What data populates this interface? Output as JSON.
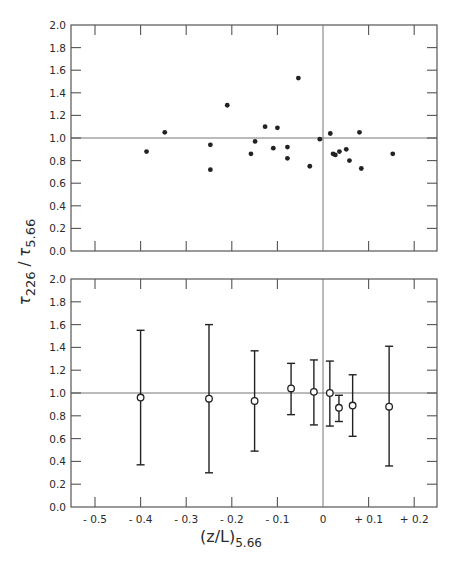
{
  "chart_data": [
    {
      "type": "scatter",
      "title": "",
      "panel": "top",
      "xlabel": "(z/L)5.66",
      "ylabel": "τ226 / τ5.66",
      "xlim": [
        -0.56,
        0.25
      ],
      "ylim": [
        0.0,
        2.0
      ],
      "xticks": [
        -0.5,
        -0.4,
        -0.3,
        -0.2,
        -0.1,
        0.0,
        0.1,
        0.2
      ],
      "yticks": [
        0.0,
        0.2,
        0.4,
        0.6,
        0.8,
        1.0,
        1.2,
        1.4,
        1.6,
        1.8,
        2.0
      ],
      "ytick_labels": [
        "0.0",
        "0.2",
        "0.4",
        "0.6",
        "0.8",
        "1.0",
        "1.2",
        "1.4",
        "1.6",
        "1.8",
        "2.0"
      ],
      "reference_lines": {
        "horizontal_y": 1.0,
        "vertical_x": 0.0
      },
      "grid": false,
      "marker": "filled-circle",
      "points": [
        {
          "x": -0.387,
          "y": 0.88
        },
        {
          "x": -0.347,
          "y": 1.05
        },
        {
          "x": -0.247,
          "y": 0.94
        },
        {
          "x": -0.247,
          "y": 0.72
        },
        {
          "x": -0.21,
          "y": 1.29
        },
        {
          "x": -0.158,
          "y": 0.86
        },
        {
          "x": -0.149,
          "y": 0.97
        },
        {
          "x": -0.127,
          "y": 1.1
        },
        {
          "x": -0.109,
          "y": 0.91
        },
        {
          "x": -0.1,
          "y": 1.09
        },
        {
          "x": -0.078,
          "y": 0.92
        },
        {
          "x": -0.078,
          "y": 0.82
        },
        {
          "x": -0.054,
          "y": 1.53
        },
        {
          "x": -0.029,
          "y": 0.75
        },
        {
          "x": -0.007,
          "y": 0.99
        },
        {
          "x": 0.016,
          "y": 1.04
        },
        {
          "x": 0.022,
          "y": 0.86
        },
        {
          "x": 0.027,
          "y": 0.85
        },
        {
          "x": 0.036,
          "y": 0.88
        },
        {
          "x": 0.051,
          "y": 0.9
        },
        {
          "x": 0.058,
          "y": 0.8
        },
        {
          "x": 0.08,
          "y": 1.05
        },
        {
          "x": 0.084,
          "y": 0.73
        },
        {
          "x": 0.153,
          "y": 0.86
        }
      ]
    },
    {
      "type": "scatter",
      "title": "",
      "panel": "bottom",
      "subtype": "errorbar",
      "xlabel": "(z/L)5.66",
      "ylabel": "τ226 / τ5.66",
      "xlim": [
        -0.56,
        0.25
      ],
      "ylim": [
        0.0,
        2.0
      ],
      "xticks": [
        -0.5,
        -0.4,
        -0.3,
        -0.2,
        -0.1,
        0.0,
        0.1,
        0.2
      ],
      "xtick_labels": [
        "- 0.5",
        "- 0.4",
        "- 0.3",
        "- 0.2",
        "- 0.1",
        "0",
        "+ 0.1",
        "+ 0.2"
      ],
      "yticks": [
        0.0,
        0.2,
        0.4,
        0.6,
        0.8,
        1.0,
        1.2,
        1.4,
        1.6,
        1.8,
        2.0
      ],
      "ytick_labels": [
        "0.0",
        "0.2",
        "0.4",
        "0.6",
        "0.8",
        "1.0",
        "1.2",
        "1.4",
        "1.6",
        "1.8",
        "2.0"
      ],
      "reference_lines": {
        "horizontal_y": 1.0,
        "vertical_x": 0.0
      },
      "grid": false,
      "marker": "open-circle",
      "points": [
        {
          "x": -0.4,
          "y": 0.96,
          "low": 0.37,
          "high": 1.55
        },
        {
          "x": -0.25,
          "y": 0.95,
          "low": 0.3,
          "high": 1.6
        },
        {
          "x": -0.15,
          "y": 0.93,
          "low": 0.49,
          "high": 1.37
        },
        {
          "x": -0.07,
          "y": 1.04,
          "low": 0.81,
          "high": 1.26
        },
        {
          "x": -0.02,
          "y": 1.01,
          "low": 0.72,
          "high": 1.29
        },
        {
          "x": 0.015,
          "y": 1.0,
          "low": 0.71,
          "high": 1.28
        },
        {
          "x": 0.035,
          "y": 0.87,
          "low": 0.75,
          "high": 0.98
        },
        {
          "x": 0.065,
          "y": 0.89,
          "low": 0.62,
          "high": 1.16
        },
        {
          "x": 0.145,
          "y": 0.88,
          "low": 0.36,
          "high": 1.41
        }
      ]
    }
  ],
  "labels": {
    "ylabel_tau": "τ",
    "ylabel_sub1": "226",
    "ylabel_slash": " / ",
    "ylabel_sub2": "5.66",
    "xlabel_main": "(z/L)",
    "xlabel_sub": "5.66"
  }
}
